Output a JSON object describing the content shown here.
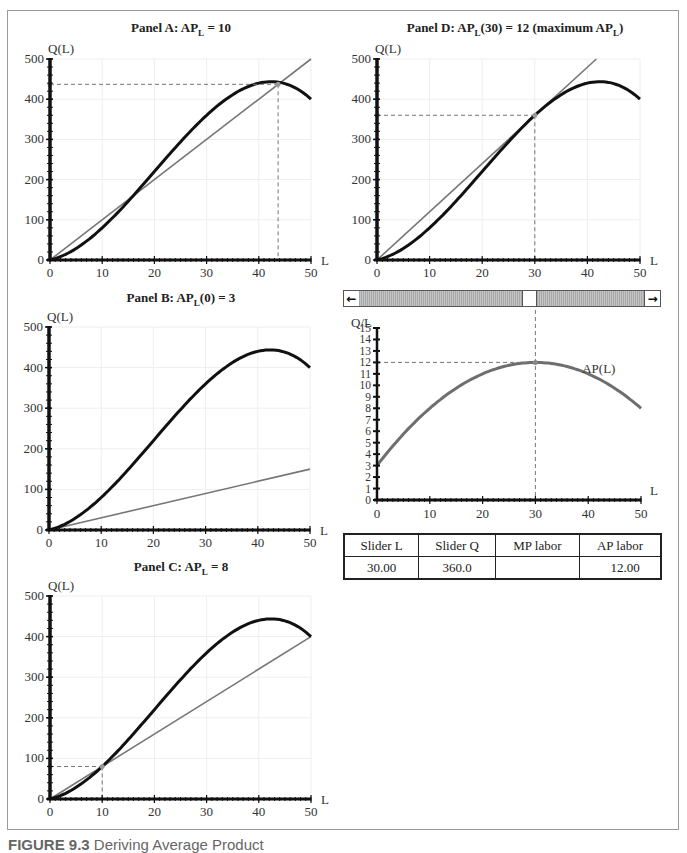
{
  "figure": {
    "caption_label": "FIGURE 9.3",
    "caption_text": "Deriving Average Product"
  },
  "panels": {
    "a": {
      "title_prefix": "Panel A: AP",
      "title_sub": "L",
      "title_suffix": " = 10"
    },
    "b": {
      "title_prefix": "Panel B: AP",
      "title_sub": "L",
      "title_suffix": "(0) = 3"
    },
    "c": {
      "title_prefix": "Panel C: AP",
      "title_sub": "L",
      "title_suffix": " = 8"
    },
    "d": {
      "title_prefix": "Panel D: AP",
      "title_sub": "L",
      "title_suffix": "(30) = 12 (maximum AP",
      "title_sub2": "L",
      "title_end": ")"
    }
  },
  "slider": {
    "left_icon": "arrow-left-icon",
    "right_icon": "arrow-right-icon",
    "left_glyph": "←",
    "right_glyph": "→",
    "value": 30,
    "min": 0,
    "max": 50
  },
  "results_table": {
    "headers": [
      "Slider L",
      "Slider Q",
      "MP labor",
      "AP labor"
    ],
    "values": [
      "30.00",
      "360.0",
      "",
      "12.00"
    ]
  },
  "colors": {
    "q_curve": "#111111",
    "ray": "#777777",
    "ap_curve": "#6e6e6e",
    "dashed": "#777777",
    "grid": "#eeeeee",
    "frame": "#9a9a9a"
  },
  "chart_data": [
    {
      "id": "panel-a",
      "type": "line",
      "title": "Panel A: AP_L = 10",
      "xlabel": "L",
      "ylabel": "Q(L)",
      "xlim": [
        0,
        50
      ],
      "ylim": [
        0,
        500
      ],
      "xticks": [
        0,
        10,
        20,
        30,
        40,
        50
      ],
      "yticks": [
        0,
        100,
        200,
        300,
        400,
        500
      ],
      "grid": true,
      "series": [
        {
          "name": "Q(L)",
          "formula": "Q = 3L + 0.6L^2 - 0.01L^3",
          "x": [
            0,
            5,
            10,
            15,
            20,
            25,
            30,
            35,
            40,
            42.4,
            45,
            50
          ],
          "values": [
            0,
            28.75,
            80,
            146.25,
            220,
            293.75,
            360,
            411.25,
            440,
            443.6,
            438.75,
            400
          ]
        },
        {
          "name": "ray AP=10",
          "x": [
            0,
            50
          ],
          "values": [
            0,
            500
          ]
        }
      ],
      "annotations": [
        {
          "type": "dashed-guide",
          "x": 43.7,
          "y": 437
        }
      ]
    },
    {
      "id": "panel-b",
      "type": "line",
      "title": "Panel B: AP_L(0) = 3",
      "xlabel": "L",
      "ylabel": "Q(L)",
      "xlim": [
        0,
        50
      ],
      "ylim": [
        0,
        500
      ],
      "xticks": [
        0,
        10,
        20,
        30,
        40,
        50
      ],
      "yticks": [
        0,
        100,
        200,
        300,
        400,
        500
      ],
      "grid": true,
      "series": [
        {
          "name": "Q(L)",
          "x": [
            0,
            5,
            10,
            15,
            20,
            25,
            30,
            35,
            40,
            42.4,
            45,
            50
          ],
          "values": [
            0,
            28.75,
            80,
            146.25,
            220,
            293.75,
            360,
            411.25,
            440,
            443.6,
            438.75,
            400
          ]
        },
        {
          "name": "ray AP=3",
          "x": [
            0,
            50
          ],
          "values": [
            0,
            150
          ]
        }
      ]
    },
    {
      "id": "panel-c",
      "type": "line",
      "title": "Panel C: AP_L = 8",
      "xlabel": "L",
      "ylabel": "Q(L)",
      "xlim": [
        0,
        50
      ],
      "ylim": [
        0,
        500
      ],
      "xticks": [
        0,
        10,
        20,
        30,
        40,
        50
      ],
      "yticks": [
        0,
        100,
        200,
        300,
        400,
        500
      ],
      "grid": true,
      "series": [
        {
          "name": "Q(L)",
          "x": [
            0,
            5,
            10,
            15,
            20,
            25,
            30,
            35,
            40,
            42.4,
            45,
            50
          ],
          "values": [
            0,
            28.75,
            80,
            146.25,
            220,
            293.75,
            360,
            411.25,
            440,
            443.6,
            438.75,
            400
          ]
        },
        {
          "name": "ray AP=8",
          "x": [
            0,
            50
          ],
          "values": [
            0,
            400
          ]
        }
      ],
      "annotations": [
        {
          "type": "dashed-guide",
          "x": 10,
          "y": 80
        }
      ]
    },
    {
      "id": "panel-d",
      "type": "line",
      "title": "Panel D: AP_L(30) = 12 (maximum AP_L)",
      "xlabel": "L",
      "ylabel": "Q(L)",
      "xlim": [
        0,
        50
      ],
      "ylim": [
        0,
        500
      ],
      "xticks": [
        0,
        10,
        20,
        30,
        40,
        50
      ],
      "yticks": [
        0,
        100,
        200,
        300,
        400,
        500
      ],
      "grid": true,
      "series": [
        {
          "name": "Q(L)",
          "x": [
            0,
            5,
            10,
            15,
            20,
            25,
            30,
            35,
            40,
            42.4,
            45,
            50
          ],
          "values": [
            0,
            28.75,
            80,
            146.25,
            220,
            293.75,
            360,
            411.25,
            440,
            443.6,
            438.75,
            400
          ]
        },
        {
          "name": "ray AP=12",
          "x": [
            0,
            41.7
          ],
          "values": [
            0,
            500
          ]
        }
      ],
      "annotations": [
        {
          "type": "dashed-guide",
          "x": 30,
          "y": 360
        }
      ]
    },
    {
      "id": "ap-chart",
      "type": "line",
      "title": "",
      "xlabel": "L",
      "ylabel": "Q/L",
      "xlim": [
        0,
        50
      ],
      "ylim": [
        0,
        15
      ],
      "xticks": [
        0,
        10,
        20,
        30,
        40,
        50
      ],
      "yticks": [
        0,
        1,
        2,
        3,
        4,
        5,
        6,
        7,
        8,
        9,
        10,
        11,
        12,
        13,
        14,
        15
      ],
      "grid": false,
      "series": [
        {
          "name": "AP(L)",
          "formula": "AP = 3 + 0.6L - 0.01L^2",
          "x": [
            0,
            5,
            10,
            15,
            20,
            25,
            30,
            35,
            40,
            45,
            50
          ],
          "values": [
            3,
            5.75,
            8,
            9.75,
            11,
            11.75,
            12,
            11.75,
            11,
            9.75,
            8
          ]
        }
      ],
      "annotations": [
        {
          "type": "label",
          "text": "AP(L)",
          "x": 40,
          "y": 11.4
        },
        {
          "type": "dashed-guide",
          "x": 30,
          "y": 12
        }
      ]
    }
  ]
}
